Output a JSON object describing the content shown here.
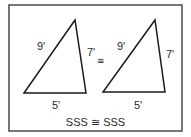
{
  "diagram": {
    "frame": {
      "stroke": "#555555"
    },
    "triangles": [
      {
        "id": "left",
        "points": [
          [
            75,
            20
          ],
          [
            24,
            93
          ],
          [
            86,
            93
          ]
        ],
        "labels": {
          "hypotenuse": "9'",
          "right_side": "7'",
          "base": "5'"
        }
      },
      {
        "id": "right",
        "points": [
          [
            155,
            20
          ],
          [
            103,
            92
          ],
          [
            165,
            92
          ]
        ],
        "labels": {
          "hypotenuse": "9'",
          "right_side": "7'",
          "base": "5'"
        }
      }
    ],
    "congruence_symbol": "≅",
    "caption": "SSS ≅ SSS"
  }
}
